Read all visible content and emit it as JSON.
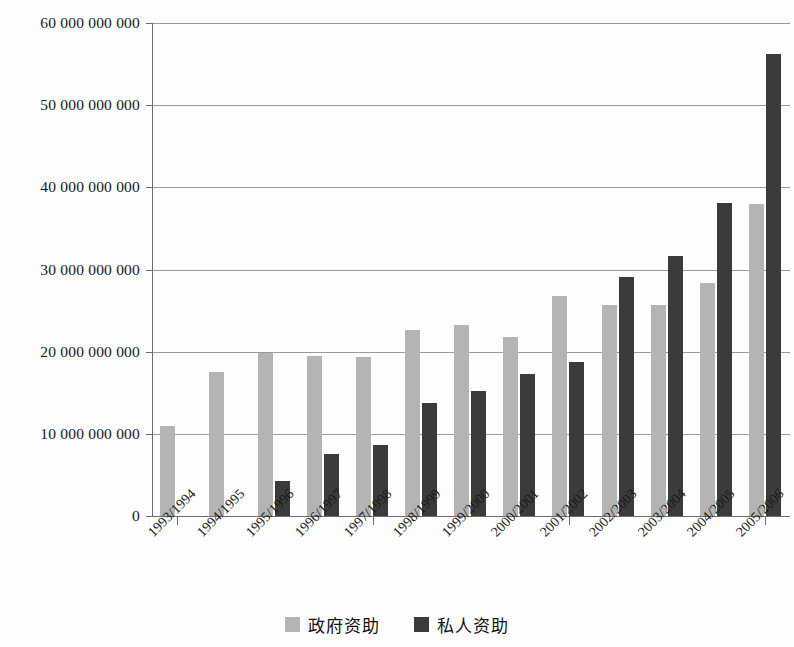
{
  "chart_data": {
    "type": "bar",
    "title": "",
    "subtitle": "",
    "xlabel": "",
    "ylabel": "",
    "ylim": [
      0,
      60000000000
    ],
    "grid": true,
    "legend_position": "bottom-center",
    "y_ticks": [
      0,
      10000000000,
      20000000000,
      30000000000,
      40000000000,
      50000000000,
      60000000000
    ],
    "y_tick_labels": [
      "0",
      "10 000 000 000",
      "20 000 000 000",
      "30 000 000 000",
      "40 000 000 000",
      "50 000 000 000",
      "60 000 000 000"
    ],
    "categories": [
      "1993/1994",
      "1994/1995",
      "1995/1996",
      "1996/1997",
      "1997/1998",
      "1998/1999",
      "1999/2000",
      "2000/2001",
      "2001/2002",
      "2002/2003",
      "2003/2004",
      "2004/2005",
      "2005/2006"
    ],
    "series": [
      {
        "name": "政府资助",
        "color": "#b4b4b4",
        "values": [
          10900000000,
          17500000000,
          19900000000,
          19500000000,
          19400000000,
          22600000000,
          23200000000,
          21800000000,
          26800000000,
          25700000000,
          25700000000,
          28300000000,
          38000000000
        ]
      },
      {
        "name": "私人资助",
        "color": "#3b3b3b",
        "values": [
          0,
          0,
          4300000000,
          7600000000,
          8700000000,
          13700000000,
          15200000000,
          17300000000,
          18800000000,
          29100000000,
          31600000000,
          38100000000,
          56200000000
        ]
      }
    ]
  },
  "legend": {
    "items": [
      {
        "label": "政府资助",
        "swatch": "gov"
      },
      {
        "label": "私人资助",
        "swatch": "priv"
      }
    ]
  }
}
